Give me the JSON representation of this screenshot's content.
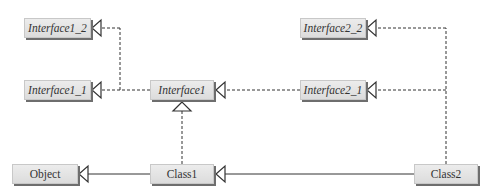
{
  "diagram": {
    "type": "uml-class-hierarchy",
    "nodes": [
      {
        "id": "interface1_2",
        "label": "Interface1_2",
        "kind": "interface"
      },
      {
        "id": "interface1_1",
        "label": "Interface1_1",
        "kind": "interface"
      },
      {
        "id": "interface1",
        "label": "Interface1",
        "kind": "interface"
      },
      {
        "id": "interface2_2",
        "label": "Interface2_2",
        "kind": "interface"
      },
      {
        "id": "interface2_1",
        "label": "Interface2_1",
        "kind": "interface"
      },
      {
        "id": "object",
        "label": "Object",
        "kind": "class"
      },
      {
        "id": "class1",
        "label": "Class1",
        "kind": "class"
      },
      {
        "id": "class2",
        "label": "Class2",
        "kind": "class"
      }
    ],
    "edges": [
      {
        "from": "interface1",
        "to": "interface1_1",
        "style": "dashed",
        "arrow": "hollow-triangle"
      },
      {
        "from": "interface1",
        "to": "interface1_2",
        "style": "dashed",
        "arrow": "hollow-triangle"
      },
      {
        "from": "interface2_1",
        "to": "interface1",
        "style": "dashed",
        "arrow": "hollow-triangle"
      },
      {
        "from": "class2",
        "to": "interface2_1",
        "style": "dashed",
        "arrow": "hollow-triangle"
      },
      {
        "from": "class2",
        "to": "interface2_2",
        "style": "dashed",
        "arrow": "hollow-triangle"
      },
      {
        "from": "class1",
        "to": "interface1",
        "style": "dashed",
        "arrow": "hollow-triangle"
      },
      {
        "from": "class1",
        "to": "object",
        "style": "solid",
        "arrow": "hollow-triangle"
      },
      {
        "from": "class2",
        "to": "class1",
        "style": "solid",
        "arrow": "hollow-triangle"
      }
    ],
    "colors": {
      "box_fill": "#e4e4e4",
      "box_shadow": "#6e6e6e",
      "line": "#333333",
      "text": "#333333"
    }
  }
}
